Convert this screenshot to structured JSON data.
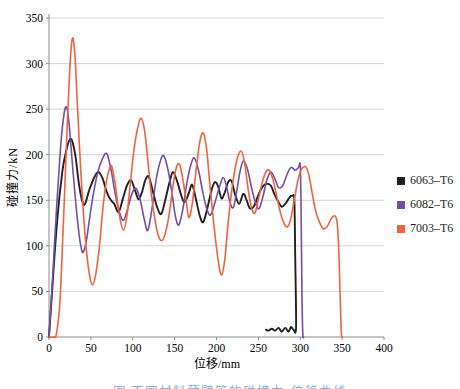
{
  "figure": {
    "y_axis_title": "碰撞力/kN",
    "x_axis_title": "位移/mm",
    "caption_partial": "图 不同材料薄壁管的碰撞力-位移曲线"
  },
  "chart_data": {
    "type": "line",
    "title": "",
    "xlabel": "位移/mm",
    "ylabel": "碰撞力/kN",
    "xlim": [
      0,
      400
    ],
    "ylim": [
      0,
      350
    ],
    "xticks": [
      0,
      50,
      100,
      150,
      200,
      250,
      300,
      350,
      400
    ],
    "yticks": [
      0,
      50,
      100,
      150,
      200,
      250,
      300,
      350
    ],
    "grid": "horizontal-only",
    "gridline_color": "#c9c9c9",
    "axis_color": "#8c8c8c",
    "legend_position": "right",
    "series": [
      {
        "name": "6063-T6",
        "color": "#231f20",
        "stroke_width": 1.9,
        "points": [
          [
            0,
            0
          ],
          [
            4,
            55
          ],
          [
            10,
            130
          ],
          [
            16,
            182
          ],
          [
            21,
            206
          ],
          [
            25,
            217
          ],
          [
            28,
            214
          ],
          [
            32,
            196
          ],
          [
            36,
            166
          ],
          [
            40,
            148
          ],
          [
            43,
            146
          ],
          [
            48,
            161
          ],
          [
            54,
            175
          ],
          [
            59,
            181
          ],
          [
            64,
            174
          ],
          [
            69,
            159
          ],
          [
            74,
            150
          ],
          [
            78,
            146
          ],
          [
            83,
            137
          ],
          [
            88,
            151
          ],
          [
            93,
            166
          ],
          [
            98,
            172
          ],
          [
            103,
            160
          ],
          [
            107,
            151
          ],
          [
            111,
            159
          ],
          [
            115,
            172
          ],
          [
            119,
            176
          ],
          [
            124,
            160
          ],
          [
            129,
            143
          ],
          [
            134,
            135
          ],
          [
            139,
            151
          ],
          [
            144,
            170
          ],
          [
            148,
            181
          ],
          [
            153,
            171
          ],
          [
            158,
            155
          ],
          [
            162,
            148
          ],
          [
            167,
            158
          ],
          [
            171,
            167
          ],
          [
            176,
            149
          ],
          [
            180,
            133
          ],
          [
            184,
            126
          ],
          [
            189,
            141
          ],
          [
            194,
            161
          ],
          [
            198,
            170
          ],
          [
            202,
            165
          ],
          [
            206,
            152
          ],
          [
            210,
            159
          ],
          [
            214,
            170
          ],
          [
            218,
            171
          ],
          [
            222,
            157
          ],
          [
            227,
            146
          ],
          [
            232,
            157
          ],
          [
            236,
            150
          ],
          [
            240,
            141
          ],
          [
            245,
            144
          ],
          [
            250,
            156
          ],
          [
            255,
            165
          ],
          [
            260,
            168
          ],
          [
            265,
            166
          ],
          [
            269,
            157
          ],
          [
            274,
            148
          ],
          [
            278,
            143
          ],
          [
            283,
            147
          ],
          [
            287,
            153
          ],
          [
            291,
            155
          ],
          [
            293,
            149
          ],
          [
            294,
            90
          ],
          [
            295,
            12
          ],
          [
            292,
            8
          ],
          [
            289,
            11
          ],
          [
            286,
            6
          ],
          [
            282,
            10
          ],
          [
            278,
            6
          ],
          [
            274,
            10
          ],
          [
            270,
            7
          ],
          [
            266,
            9
          ],
          [
            262,
            7
          ],
          [
            259,
            8
          ]
        ]
      },
      {
        "name": "6082-T6",
        "color": "#6f4fa8",
        "stroke_width": 1.6,
        "points": [
          [
            0,
            0
          ],
          [
            4,
            60
          ],
          [
            9,
            140
          ],
          [
            14,
            210
          ],
          [
            18,
            245
          ],
          [
            21,
            252
          ],
          [
            24,
            234
          ],
          [
            29,
            178
          ],
          [
            34,
            128
          ],
          [
            38,
            100
          ],
          [
            41,
            93
          ],
          [
            45,
            108
          ],
          [
            51,
            146
          ],
          [
            58,
            180
          ],
          [
            64,
            196
          ],
          [
            69,
            201
          ],
          [
            74,
            184
          ],
          [
            79,
            157
          ],
          [
            84,
            137
          ],
          [
            89,
            128
          ],
          [
            94,
            141
          ],
          [
            99,
            157
          ],
          [
            104,
            163
          ],
          [
            109,
            150
          ],
          [
            114,
            128
          ],
          [
            118,
            117
          ],
          [
            123,
            141
          ],
          [
            128,
            173
          ],
          [
            133,
            193
          ],
          [
            137,
            199
          ],
          [
            142,
            184
          ],
          [
            147,
            157
          ],
          [
            151,
            132
          ],
          [
            155,
            123
          ],
          [
            160,
            141
          ],
          [
            165,
            171
          ],
          [
            170,
            191
          ],
          [
            174,
            196
          ],
          [
            179,
            181
          ],
          [
            184,
            157
          ],
          [
            189,
            139
          ],
          [
            193,
            134
          ],
          [
            198,
            147
          ],
          [
            203,
            163
          ],
          [
            208,
            175
          ],
          [
            212,
            165
          ],
          [
            216,
            148
          ],
          [
            220,
            142
          ],
          [
            224,
            159
          ],
          [
            228,
            181
          ],
          [
            232,
            193
          ],
          [
            237,
            184
          ],
          [
            242,
            163
          ],
          [
            247,
            146
          ],
          [
            251,
            141
          ],
          [
            256,
            156
          ],
          [
            260,
            172
          ],
          [
            265,
            181
          ],
          [
            270,
            173
          ],
          [
            274,
            164
          ],
          [
            279,
            166
          ],
          [
            284,
            178
          ],
          [
            289,
            186
          ],
          [
            294,
            183
          ],
          [
            298,
            186
          ],
          [
            300,
            188
          ],
          [
            301,
            140
          ],
          [
            302,
            50
          ],
          [
            303,
            4
          ],
          [
            304,
            0
          ]
        ]
      },
      {
        "name": "7003-T6",
        "color": "#f2623e",
        "stroke_width": 1.6,
        "points": [
          [
            0,
            0
          ],
          [
            6,
            0
          ],
          [
            9,
            4
          ],
          [
            13,
            38
          ],
          [
            17,
            120
          ],
          [
            21,
            215
          ],
          [
            25,
            297
          ],
          [
            28,
            328
          ],
          [
            31,
            308
          ],
          [
            34,
            252
          ],
          [
            38,
            182
          ],
          [
            43,
            112
          ],
          [
            48,
            70
          ],
          [
            52,
            57
          ],
          [
            56,
            70
          ],
          [
            60,
            98
          ],
          [
            64,
            138
          ],
          [
            68,
            168
          ],
          [
            72,
            184
          ],
          [
            75,
            187
          ],
          [
            79,
            168
          ],
          [
            84,
            134
          ],
          [
            89,
            117
          ],
          [
            93,
            133
          ],
          [
            97,
            167
          ],
          [
            101,
            202
          ],
          [
            106,
            230
          ],
          [
            110,
            240
          ],
          [
            114,
            227
          ],
          [
            118,
            194
          ],
          [
            122,
            158
          ],
          [
            127,
            126
          ],
          [
            131,
            110
          ],
          [
            135,
            106
          ],
          [
            139,
            114
          ],
          [
            143,
            132
          ],
          [
            148,
            165
          ],
          [
            152,
            186
          ],
          [
            156,
            189
          ],
          [
            160,
            172
          ],
          [
            164,
            148
          ],
          [
            167,
            131
          ],
          [
            171,
            146
          ],
          [
            176,
            186
          ],
          [
            180,
            214
          ],
          [
            184,
            224
          ],
          [
            188,
            208
          ],
          [
            192,
            168
          ],
          [
            197,
            122
          ],
          [
            202,
            84
          ],
          [
            206,
            68
          ],
          [
            210,
            86
          ],
          [
            214,
            126
          ],
          [
            219,
            166
          ],
          [
            224,
            193
          ],
          [
            229,
            204
          ],
          [
            233,
            194
          ],
          [
            238,
            161
          ],
          [
            242,
            141
          ],
          [
            246,
            136
          ],
          [
            250,
            151
          ],
          [
            255,
            171
          ],
          [
            259,
            181
          ],
          [
            263,
            183
          ],
          [
            268,
            171
          ],
          [
            272,
            154
          ],
          [
            277,
            134
          ],
          [
            281,
            124
          ],
          [
            285,
            121
          ],
          [
            289,
            131
          ],
          [
            293,
            151
          ],
          [
            297,
            171
          ],
          [
            301,
            183
          ],
          [
            306,
            187
          ],
          [
            310,
            179
          ],
          [
            314,
            159
          ],
          [
            318,
            140
          ],
          [
            322,
            128
          ],
          [
            327,
            119
          ],
          [
            332,
            121
          ],
          [
            337,
            130
          ],
          [
            341,
            133
          ],
          [
            344,
            126
          ],
          [
            346,
            95
          ],
          [
            348,
            35
          ],
          [
            349,
            5
          ],
          [
            350,
            0
          ]
        ]
      }
    ]
  }
}
